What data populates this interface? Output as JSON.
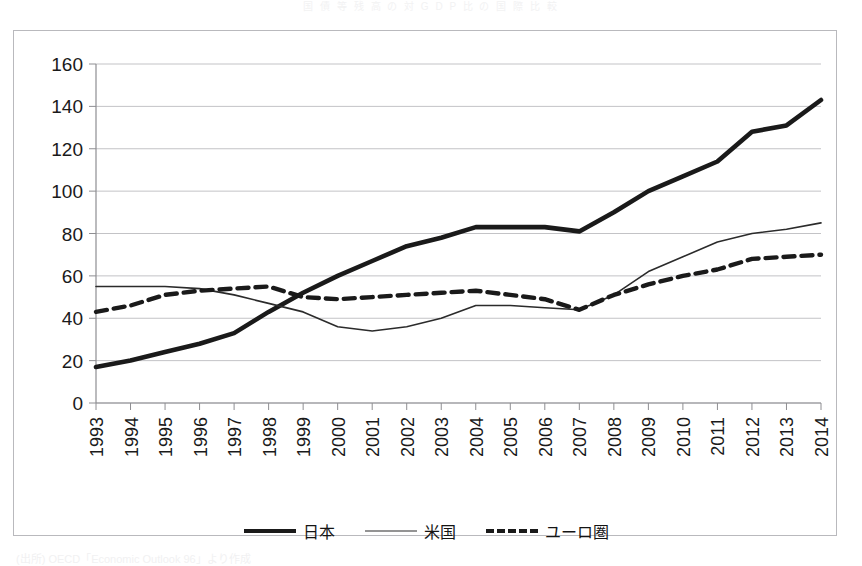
{
  "top_strip_text": "国 債 等 残 高 の 対 G D P 比 の 国 際 比 較",
  "source_note": "(出所) OECD「Economic Outlook 96」より作成",
  "chart_data": {
    "type": "line",
    "title": "",
    "xlabel": "",
    "ylabel": "",
    "x": [
      1993,
      1994,
      1995,
      1996,
      1997,
      1998,
      1999,
      2000,
      2001,
      2002,
      2003,
      2004,
      2005,
      2006,
      2007,
      2008,
      2009,
      2010,
      2011,
      2012,
      2013,
      2014
    ],
    "xtick_labels": [
      "1993",
      "1994",
      "1995",
      "1996",
      "1997",
      "1998",
      "1999",
      "2000",
      "2001",
      "2002",
      "2003",
      "2004",
      "2005",
      "2006",
      "2007",
      "2008",
      "2009",
      "2010",
      "2011",
      "2012",
      "2013",
      "2014"
    ],
    "xtick_rotation": -90,
    "ytick_labels": [
      "0",
      "20",
      "40",
      "60",
      "80",
      "100",
      "120",
      "140",
      "160"
    ],
    "yticks": [
      0,
      20,
      40,
      60,
      80,
      100,
      120,
      140,
      160
    ],
    "ylim": [
      0,
      160
    ],
    "grid": "horizontal",
    "legend_position": "bottom",
    "series": [
      {
        "name": "日本",
        "style": "thick-solid",
        "color": "#1a1a1a",
        "values": [
          17,
          20,
          24,
          28,
          33,
          43,
          52,
          60,
          67,
          74,
          78,
          83,
          83,
          83,
          81,
          90,
          100,
          107,
          114,
          128,
          131,
          143
        ]
      },
      {
        "name": "米国",
        "style": "thin-solid",
        "color": "#2b2b2b",
        "values": [
          55,
          55,
          55,
          54,
          51,
          47,
          43,
          36,
          34,
          36,
          40,
          46,
          46,
          45,
          44,
          51,
          62,
          69,
          76,
          80,
          82,
          85
        ]
      },
      {
        "name": "ユーロ圏",
        "style": "dashed",
        "color": "#1a1a1a",
        "values": [
          43,
          46,
          51,
          53,
          54,
          55,
          50,
          49,
          50,
          51,
          52,
          53,
          51,
          49,
          44,
          51,
          56,
          60,
          63,
          68,
          69,
          70
        ]
      }
    ]
  },
  "legend": {
    "items": [
      {
        "label": "日本",
        "swatch": "thick-solid-line-swatch"
      },
      {
        "label": "米国",
        "swatch": "thin-solid-line-swatch"
      },
      {
        "label": "ユーロ圏",
        "swatch": "dashed-line-swatch"
      }
    ]
  }
}
